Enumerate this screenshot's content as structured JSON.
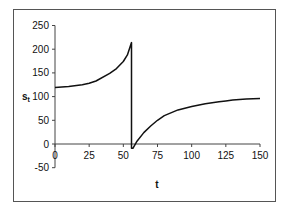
{
  "chart_data": {
    "type": "line",
    "title": "",
    "xlabel": "t",
    "ylabel": "s",
    "ylabel_subscript": "t",
    "xlim": [
      0,
      150
    ],
    "ylim": [
      -50,
      250
    ],
    "x_ticks": [
      0,
      25,
      50,
      75,
      100,
      125,
      150
    ],
    "y_ticks": [
      250,
      200,
      150,
      100,
      50,
      0,
      -50
    ],
    "x_tick_labels": [
      "0",
      "25",
      "50",
      "75",
      "100",
      "125",
      "150"
    ],
    "y_tick_labels": [
      "250",
      "200",
      "150",
      "100",
      "50",
      "0",
      "-50"
    ],
    "grid": false,
    "legend": null,
    "series": [
      {
        "name": "s_t",
        "color": "#111111",
        "x": [
          0,
          10,
          20,
          25,
          30,
          40,
          45,
          50,
          53,
          56,
          56,
          57,
          60,
          65,
          70,
          75,
          80,
          90,
          100,
          110,
          120,
          125,
          130,
          140,
          150
        ],
        "values": [
          119,
          121,
          125,
          128,
          133,
          149,
          159,
          174,
          188,
          214,
          -9,
          -9,
          6,
          24,
          38,
          50,
          60,
          72,
          79,
          85,
          89,
          91,
          93,
          95,
          96
        ]
      }
    ]
  }
}
